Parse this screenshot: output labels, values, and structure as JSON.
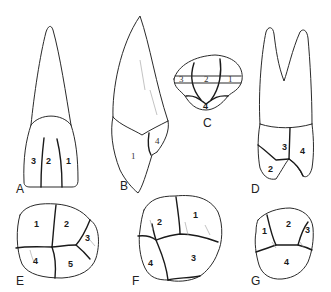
{
  "figure": {
    "panels": [
      {
        "id": "A",
        "label": "A",
        "view": "maxillary central incisor, labial view",
        "lobes": [
          "3",
          "2",
          "1"
        ]
      },
      {
        "id": "B",
        "label": "B",
        "view": "maxillary incisor, proximal view",
        "lobes": [
          "1",
          "4"
        ]
      },
      {
        "id": "C",
        "label": "C",
        "view": "incisal view",
        "lobes": [
          "3",
          "2",
          "1",
          "4"
        ]
      },
      {
        "id": "D",
        "label": "D",
        "view": "maxillary premolar/molar, proximal view",
        "lobes": [
          "3",
          "4",
          "2"
        ]
      },
      {
        "id": "E",
        "label": "E",
        "view": "mandibular first molar, occlusal view",
        "lobes": [
          "1",
          "2",
          "3",
          "4",
          "5"
        ]
      },
      {
        "id": "F",
        "label": "F",
        "view": "maxillary molar, occlusal view",
        "lobes": [
          "2",
          "1",
          "4",
          "3"
        ]
      },
      {
        "id": "G",
        "label": "G",
        "view": "premolar, occlusal view",
        "lobes": [
          "2",
          "1",
          "3",
          "4"
        ]
      }
    ]
  },
  "colors": {
    "line": "#2a2a2a",
    "background": "#ffffff"
  }
}
